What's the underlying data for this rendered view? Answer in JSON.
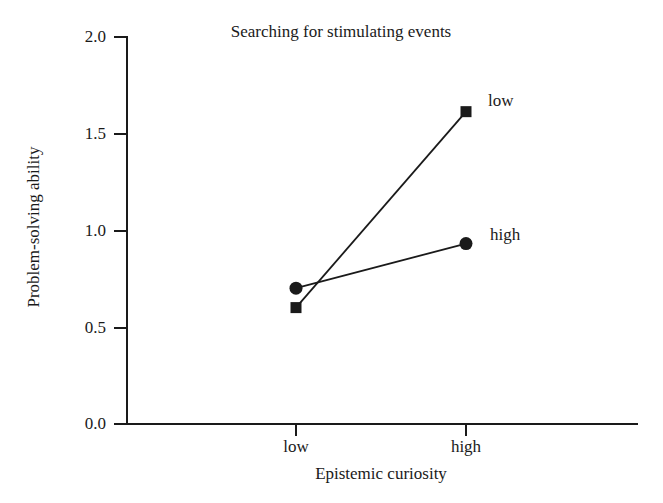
{
  "chart_data": {
    "type": "line",
    "title": "Searching for stimulating events",
    "xlabel": "Epistemic curiosity",
    "ylabel": "Problem-solving ability",
    "categories": [
      "low",
      "high"
    ],
    "x": [
      0,
      1
    ],
    "series": [
      {
        "name": "low",
        "marker": "square",
        "values": [
          0.6,
          1.61
        ],
        "label_text": "low"
      },
      {
        "name": "high",
        "marker": "circle",
        "values": [
          0.7,
          0.93
        ],
        "label_text": "high"
      }
    ],
    "ylim": [
      0.0,
      2.0
    ],
    "ytick_labels": [
      "2.0",
      "1.5",
      "1.0",
      "0.5",
      "0.0"
    ],
    "ytick_values": [
      2.0,
      1.5,
      1.0,
      0.5,
      0.0
    ],
    "xtick_labels": [
      "low",
      "high"
    ],
    "grid": false,
    "legend": "inline-right-of-endpoints",
    "line_color": "#1a1a1a",
    "marker_color": "#1a1a1a",
    "background_color": "#ffffff"
  },
  "axes": {
    "y_ticks": [
      {
        "label": "2.0"
      },
      {
        "label": "1.5"
      },
      {
        "label": "1.0"
      },
      {
        "label": "0.5"
      },
      {
        "label": "0.0"
      }
    ],
    "x_ticks": [
      {
        "label": "low"
      },
      {
        "label": "high"
      }
    ]
  }
}
